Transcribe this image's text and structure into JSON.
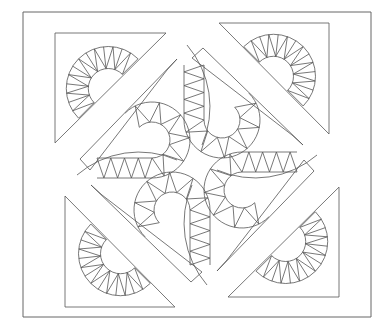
{
  "figure": {
    "kind": "quilt-block-line-drawing",
    "width": 391,
    "height": 328,
    "background": "#ffffff",
    "stroke": "#555555",
    "outer_border": {
      "x": 23,
      "y": 12,
      "w": 348,
      "h": 305
    },
    "center": {
      "x": 197,
      "y": 165
    },
    "corner_triangle": {
      "leg": 111,
      "inset_x": 32,
      "inset_y": 21
    },
    "corner_fan": {
      "outer_r": 42,
      "inner_r": 20,
      "spikes": 14
    },
    "center_arc": {
      "cx_offset": -45,
      "cy_offset": -25,
      "outer_r": 38,
      "inner_r": 18,
      "spikes": 12,
      "straight_spikes": 8,
      "straight_len": 55
    },
    "quadrants": [
      {
        "name": "top-left",
        "rotation": 0
      },
      {
        "name": "top-right",
        "rotation": 90
      },
      {
        "name": "bottom-right",
        "rotation": 180
      },
      {
        "name": "bottom-left",
        "rotation": 270
      }
    ]
  }
}
